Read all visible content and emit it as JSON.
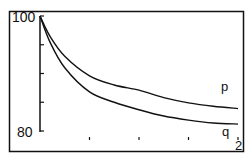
{
  "chart_data": {
    "type": "line",
    "title": "",
    "xlabel": "",
    "ylabel": "",
    "x_tick_labels": [
      "",
      "",
      "",
      "2"
    ],
    "y_tick_labels": [
      "100",
      "80"
    ],
    "xlim": [
      0,
      2
    ],
    "ylim": [
      80,
      100
    ],
    "grid": false,
    "legend": "inline labels at right end of curves",
    "x": [
      0,
      0.1,
      0.25,
      0.5,
      0.75,
      1.0,
      1.25,
      1.5,
      1.75,
      2.0
    ],
    "series": [
      {
        "name": "p",
        "values": [
          100,
          96.5,
          93.0,
          89.6,
          88.0,
          87.1,
          85.8,
          84.9,
          84.3,
          83.9
        ]
      },
      {
        "name": "q",
        "values": [
          100,
          95.5,
          91.0,
          86.8,
          85.0,
          83.7,
          82.6,
          81.9,
          81.4,
          81.2
        ]
      }
    ]
  },
  "labels": {
    "y_top": "100",
    "y_bottom": "80",
    "x_end": "2",
    "series_p": "p",
    "series_q": "q"
  }
}
